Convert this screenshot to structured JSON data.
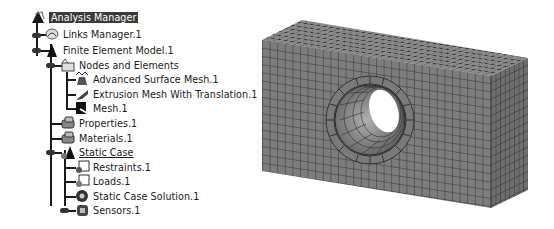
{
  "tree": {
    "root": {
      "label": "Analysis Manager",
      "icon": "analysis-manager-icon",
      "selected": true
    },
    "items": [
      {
        "label": "Links Manager.1",
        "icon": "links-manager-icon"
      },
      {
        "label": "Finite Element Model.1",
        "icon": "finite-element-model-icon"
      },
      {
        "label": "Nodes and Elements",
        "icon": "nodes-elements-icon"
      },
      {
        "label": "Advanced Surface Mesh.1",
        "icon": "surface-mesh-icon"
      },
      {
        "label": "Extrusion Mesh With Translation.1",
        "icon": "extrusion-mesh-icon"
      },
      {
        "label": "Mesh.1",
        "icon": "mesh-icon"
      },
      {
        "label": "Properties.1",
        "icon": "properties-icon"
      },
      {
        "label": "Materials.1",
        "icon": "materials-icon"
      },
      {
        "label": "Static Case",
        "icon": "static-case-icon",
        "underlined": true
      },
      {
        "label": "Restraints.1",
        "icon": "restraints-icon"
      },
      {
        "label": "Loads.1",
        "icon": "loads-icon"
      },
      {
        "label": "Static Case Solution.1",
        "icon": "solution-icon"
      },
      {
        "label": "Sensors.1",
        "icon": "sensors-icon"
      }
    ]
  },
  "viewport": {
    "description": "3D hexahedral mesh of rectangular block with cylindrical hole",
    "mesh_color": "#7a7a7a",
    "edge_color": "#2b2b2b"
  }
}
